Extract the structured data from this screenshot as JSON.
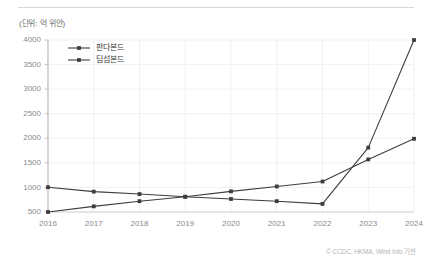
{
  "figure": {
    "unit_label": "(단위: 억 위안)",
    "credit": "© CCDC, HKMA, Wind Info 기반"
  },
  "chart_data": {
    "type": "line",
    "title": "",
    "subtitle": "",
    "xlabel": "(연도)",
    "ylabel": "(단위: 억 위안)",
    "categories": [
      "2016",
      "2017",
      "2018",
      "2019",
      "2020",
      "2021",
      "2022",
      "2023",
      "2024"
    ],
    "xtick_labels": [
      "2016",
      "2017",
      "2018",
      "2019",
      "2020",
      "2021",
      "2022",
      "2023",
      "2024"
    ],
    "ytick_labels": [
      "500",
      "1000",
      "1500",
      "2000",
      "2500",
      "3000",
      "3500",
      "4000"
    ],
    "yticks": [
      500,
      1000,
      1500,
      2000,
      2500,
      3000,
      3500,
      4000
    ],
    "ylim": [
      300,
      4000
    ],
    "grid": true,
    "legend_position": "upper-left",
    "series": [
      {
        "name": "판다본드",
        "color": "#3c3c3c",
        "marker": "square",
        "values": [
          500,
          615,
          720,
          810,
          920,
          1020,
          1120,
          1570,
          1990
        ]
      },
      {
        "name": "딤섬본드",
        "color": "#3c3c3c",
        "marker": "square",
        "values": [
          1005,
          915,
          865,
          810,
          765,
          720,
          665,
          1810,
          4000
        ]
      }
    ]
  }
}
